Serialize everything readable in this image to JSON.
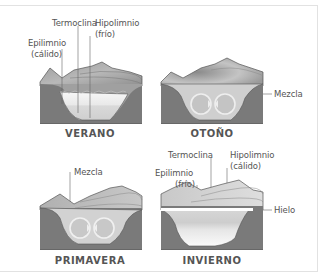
{
  "diagram": {
    "panels": [
      {
        "season": "VERANO",
        "labels": [
          "Termoclina",
          "Hipolimnio",
          "(frío)",
          "Epilimnio",
          "(cálido)"
        ],
        "state": "estratificado"
      },
      {
        "season": "OTOÑO",
        "labels": [
          "Mezcla"
        ],
        "state": "mezcla"
      },
      {
        "season": "PRIMAVERA",
        "labels": [
          "Mezcla"
        ],
        "state": "mezcla"
      },
      {
        "season": "INVIERNO",
        "labels": [
          "Termoclina",
          "Hipolimnio",
          "(cálido)",
          "Epilimnio",
          "(frío)",
          "Hielo"
        ],
        "state": "estratificado con hielo"
      }
    ],
    "colors": {
      "ground": "#7a7a7a",
      "mountain": "#a8a8a8",
      "water_light": "#f0f0f0",
      "text": "#555555",
      "frame": "#e2e2e2"
    }
  }
}
